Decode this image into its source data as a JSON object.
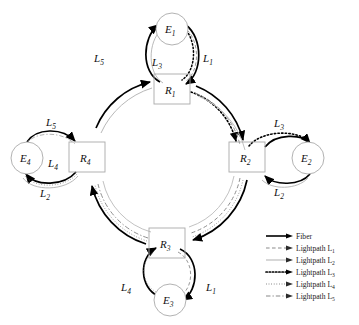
{
  "figure": {
    "type": "ring-network-lightpath-diagram",
    "background": "#ffffff",
    "ring": {
      "center_x": 172,
      "center_y": 150,
      "radius": 78
    }
  },
  "nodes": {
    "routers": [
      {
        "id": "R1",
        "label": "R",
        "sub": "1",
        "shape": "rectangle",
        "x": 172,
        "y": 89,
        "w": 36,
        "h": 30
      },
      {
        "id": "R2",
        "label": "R",
        "sub": "2",
        "shape": "rectangle",
        "x": 247,
        "y": 157,
        "w": 36,
        "h": 30
      },
      {
        "id": "R3",
        "label": "R",
        "sub": "3",
        "shape": "rectangle",
        "x": 167,
        "y": 243,
        "w": 36,
        "h": 30
      },
      {
        "id": "R4",
        "label": "R",
        "sub": "4",
        "shape": "rectangle",
        "x": 87,
        "y": 157,
        "w": 36,
        "h": 30
      }
    ],
    "edges": [
      {
        "id": "E1",
        "label": "E",
        "sub": "1",
        "shape": "circle",
        "cx": 172,
        "cy": 29,
        "r": 16
      },
      {
        "id": "E2",
        "label": "E",
        "sub": "2",
        "shape": "circle",
        "cx": 308,
        "cy": 158,
        "r": 16
      },
      {
        "id": "E3",
        "label": "E",
        "sub": "3",
        "shape": "circle",
        "cx": 170,
        "cy": 300,
        "r": 16
      },
      {
        "id": "E4",
        "label": "E",
        "sub": "4",
        "shape": "circle",
        "cx": 27,
        "cy": 158,
        "r": 16
      }
    ]
  },
  "edge_labels": [
    {
      "text": "L",
      "sub": "5",
      "x": 100,
      "y": 62,
      "name": "label-L5-top"
    },
    {
      "text": "L",
      "sub": "3",
      "x": 155,
      "y": 64,
      "name": "label-L3-top"
    },
    {
      "text": "L",
      "sub": "1",
      "x": 203,
      "y": 62,
      "name": "label-L1-top"
    },
    {
      "text": "L",
      "sub": "5",
      "x": 52,
      "y": 126,
      "name": "label-L5-left"
    },
    {
      "text": "L",
      "sub": "4",
      "x": 49,
      "y": 166,
      "name": "label-L4-left"
    },
    {
      "text": "L",
      "sub": "2",
      "x": 44,
      "y": 196,
      "name": "label-L2-left"
    },
    {
      "text": "L",
      "sub": "3",
      "x": 277,
      "y": 127,
      "name": "label-L3-right"
    },
    {
      "text": "L",
      "sub": "2",
      "x": 277,
      "y": 195,
      "name": "label-L2-right"
    },
    {
      "text": "L",
      "sub": "4",
      "x": 126,
      "y": 290,
      "name": "label-L4-bottom"
    },
    {
      "text": "L",
      "sub": "1",
      "x": 209,
      "y": 290,
      "name": "label-L1-bottom"
    }
  ],
  "legend": {
    "x": 266,
    "y": 232,
    "row_height": 12,
    "items": [
      {
        "label": "Fiber",
        "sub": "",
        "style": "solid",
        "color": "#000000"
      },
      {
        "label": "Lightpath L",
        "sub": "1",
        "style": "dashed",
        "color": "#808080"
      },
      {
        "label": "Lightpath L",
        "sub": "2",
        "style": "solid-light",
        "color": "#b0b0b0"
      },
      {
        "label": "Lightpath L",
        "sub": "3",
        "style": "dotted-heavy",
        "color": "#000000"
      },
      {
        "label": "Lightpath L",
        "sub": "4",
        "style": "dotted-fine",
        "color": "#707070"
      },
      {
        "label": "Lightpath L",
        "sub": "5",
        "style": "dash-dot",
        "color": "#8a8a8a"
      }
    ]
  },
  "colors": {
    "fiber": "#000000",
    "node_stroke": "#a9a9a9",
    "text": "#111111",
    "L1": "#8c8c8c",
    "L2": "#b8b8b8",
    "L3": "#000000",
    "L4": "#6f6f6f",
    "L5": "#909090"
  }
}
